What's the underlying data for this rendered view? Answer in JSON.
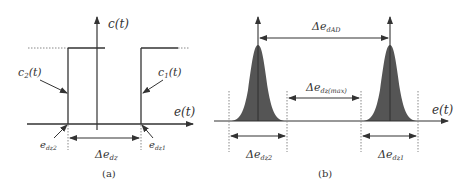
{
  "panel_a": {
    "caption": "(a)",
    "y_axis_label": "c(t)",
    "x_axis_label": "e(t)",
    "curve_left_label": "c₂(t)",
    "curve_right_label": "c₁(t)",
    "left_threshold_label": "e_dz2",
    "right_threshold_label": "e_dz1",
    "width_label": "Δe_dz",
    "left_threshold_base": "e",
    "left_threshold_sub": "dz2",
    "right_threshold_base": "e",
    "right_threshold_sub": "dz1",
    "width_base": "Δe",
    "width_sub": "dz",
    "curve_left_base": "c",
    "curve_left_sub": "2",
    "curve_left_arg": "(t)",
    "curve_right_base": "c",
    "curve_right_sub": "1",
    "curve_right_arg": "(t)"
  },
  "panel_b": {
    "caption": "(b)",
    "x_axis_label": "e(t)",
    "peak_distance_label": "Δe_dAD",
    "peak_distance_base": "Δe",
    "peak_distance_sub": "dAD",
    "gap_label": "Δe_dz(max)",
    "gap_base": "Δe",
    "gap_sub": "dz(max)",
    "left_width_label": "Δe_dz2",
    "left_width_base": "Δe",
    "left_width_sub": "dz2",
    "right_width_label": "Δe_dz1",
    "right_width_base": "Δe",
    "right_width_sub": "dz1"
  },
  "colors": {
    "line": "#333333",
    "fill": "#555555",
    "dotted": "#888888"
  }
}
